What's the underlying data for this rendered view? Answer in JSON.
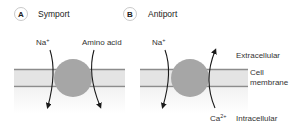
{
  "panels": [
    {
      "badge": "A",
      "title": "Symport",
      "labels": {
        "left": "Na",
        "left_sup": "+",
        "right": "Amino acid"
      }
    },
    {
      "badge": "B",
      "title": "Antiport",
      "labels": {
        "left": "Na",
        "left_sup": "+",
        "right": "Ca",
        "right_sup": "2+"
      }
    }
  ],
  "side_labels": {
    "extracellular": "Extracellular",
    "cell_membrane_line1": "Cell",
    "cell_membrane_line2": "membrane",
    "intracellular": "Intracellular"
  },
  "colors": {
    "membrane_fill": "#e4e4e4",
    "membrane_line": "#8c8c8c",
    "transporter": "#a6a6a6",
    "arrow": "#1a1a1a"
  }
}
